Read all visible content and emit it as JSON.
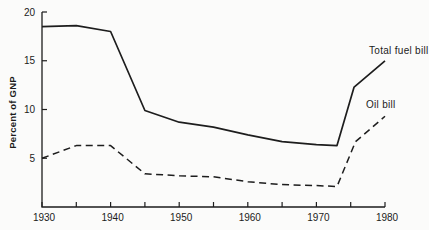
{
  "figure": {
    "background": "#fbfbfa",
    "ink": "#1d1d1d"
  },
  "chart_data": {
    "type": "line",
    "title": "",
    "xlabel": "",
    "ylabel": "Percent of GNP",
    "xlim": [
      1930,
      1980
    ],
    "ylim": [
      0,
      20
    ],
    "grid": false,
    "legend_position": "inline-annotations",
    "x_major_ticks": [
      1930,
      1940,
      1950,
      1960,
      1970,
      1980
    ],
    "x_tick_labels": [
      "1930",
      "1940",
      "1950",
      "1960",
      "1970",
      "1980"
    ],
    "x_minor_step": 5,
    "y_ticks": [
      5,
      10,
      15,
      20
    ],
    "y_tick_labels": [
      "5",
      "10",
      "15",
      "20"
    ],
    "series": [
      {
        "name": "Total fuel bill",
        "style": "solid",
        "points": [
          [
            1930,
            18.5
          ],
          [
            1935,
            18.6
          ],
          [
            1940,
            18.0
          ],
          [
            1945,
            9.9
          ],
          [
            1950,
            8.7
          ],
          [
            1955,
            8.2
          ],
          [
            1960,
            7.4
          ],
          [
            1965,
            6.7
          ],
          [
            1970,
            6.4
          ],
          [
            1973,
            6.3
          ],
          [
            1975.5,
            12.3
          ],
          [
            1980,
            15.0
          ]
        ]
      },
      {
        "name": "Oil bill",
        "style": "dashed",
        "points": [
          [
            1930,
            5.0
          ],
          [
            1935,
            6.3
          ],
          [
            1940,
            6.3
          ],
          [
            1945,
            3.4
          ],
          [
            1950,
            3.2
          ],
          [
            1955,
            3.1
          ],
          [
            1960,
            2.6
          ],
          [
            1965,
            2.3
          ],
          [
            1970,
            2.2
          ],
          [
            1973,
            2.1
          ],
          [
            1975.7,
            6.7
          ],
          [
            1980,
            9.3
          ]
        ]
      }
    ]
  }
}
